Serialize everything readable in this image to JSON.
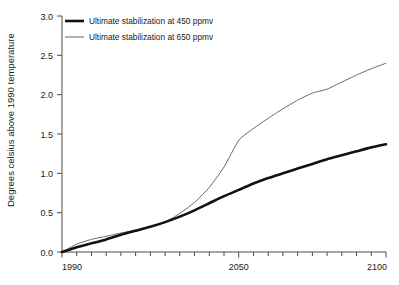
{
  "chart_data": {
    "type": "line",
    "title": "",
    "xlabel": "",
    "ylabel": "Degrees celsius above 1990 temperature",
    "xlim": [
      1990,
      2100
    ],
    "ylim": [
      0.0,
      3.0
    ],
    "grid": false,
    "legend_position": "top-left",
    "x_ticks": [
      1990,
      2050,
      2100
    ],
    "x_tick_labels": [
      "1990",
      "2050",
      "2100"
    ],
    "x_minor_tick_step": 5,
    "y_ticks": [
      0.0,
      0.5,
      1.0,
      1.5,
      2.0,
      2.5,
      3.0
    ],
    "y_tick_labels": [
      "0.0",
      "0.5",
      "1.0",
      "1.5",
      "2.0",
      "2.5",
      "3.0"
    ],
    "x": [
      1990,
      1995,
      2000,
      2005,
      2010,
      2015,
      2020,
      2025,
      2030,
      2035,
      2040,
      2045,
      2050,
      2055,
      2060,
      2065,
      2070,
      2075,
      2080,
      2085,
      2090,
      2095,
      2100
    ],
    "series": [
      {
        "name": "Ultimate stabilization at 450 ppmv",
        "color": "#111111",
        "line_width": "thick",
        "values": [
          0.0,
          0.06,
          0.11,
          0.16,
          0.22,
          0.27,
          0.32,
          0.38,
          0.45,
          0.53,
          0.62,
          0.71,
          0.79,
          0.87,
          0.94,
          1.0,
          1.06,
          1.12,
          1.18,
          1.23,
          1.28,
          1.33,
          1.37
        ]
      },
      {
        "name": "Ultimate stabilization at 650 ppmv",
        "color": "#555555",
        "line_width": "thin",
        "values": [
          0.0,
          0.1,
          0.16,
          0.2,
          0.24,
          0.28,
          0.32,
          0.38,
          0.49,
          0.63,
          0.82,
          1.08,
          1.42,
          1.57,
          1.7,
          1.82,
          1.93,
          2.02,
          2.07,
          2.16,
          2.25,
          2.33,
          2.4
        ]
      }
    ],
    "legend": [
      {
        "label": "Ultimate stabilization at 450 ppmv",
        "swatch": "thick-line-swatch"
      },
      {
        "label": "Ultimate stabilization at 650 ppmv",
        "swatch": "thin-line-swatch"
      }
    ]
  }
}
